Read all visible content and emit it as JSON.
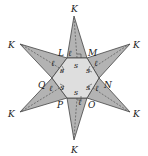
{
  "figure": {
    "colors": {
      "hexagon_fill": "#dedede",
      "triangle_fill": "#b3b3b3",
      "stroke": "#444444",
      "dashed_line": "#555555"
    },
    "hexagon_vertices": [
      {
        "label": "L"
      },
      {
        "label": "M"
      },
      {
        "label": "N"
      },
      {
        "label": "O"
      },
      {
        "label": "P"
      },
      {
        "label": "Q"
      }
    ],
    "apex_label": "K",
    "apexes": [
      {
        "label": "K",
        "position": "top"
      },
      {
        "label": "K",
        "position": "upper-right"
      },
      {
        "label": "K",
        "position": "lower-right"
      },
      {
        "label": "K",
        "position": "bottom"
      },
      {
        "label": "K",
        "position": "lower-left"
      },
      {
        "label": "K",
        "position": "upper-left"
      }
    ],
    "side_label": "s",
    "slant_height_label": "ℓ",
    "side_labels": [
      "s",
      "s",
      "s",
      "s",
      "s",
      "s"
    ],
    "slant_labels": [
      "ℓ",
      "ℓ",
      "ℓ",
      "ℓ",
      "ℓ",
      "ℓ"
    ]
  }
}
